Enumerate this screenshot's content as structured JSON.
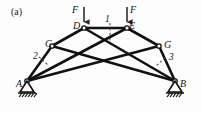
{
  "figure": {
    "panel_label": "(a)",
    "type": "truss-free-body-diagram",
    "width": 202,
    "height": 113,
    "background_color": "#fdfdfd",
    "line_color": "#111111"
  },
  "nodes": [
    {
      "id": "A",
      "label": "A",
      "x": 27,
      "y": 81,
      "support": "pin"
    },
    {
      "id": "B",
      "label": "B",
      "x": 175,
      "y": 81,
      "support": "roller"
    },
    {
      "id": "C",
      "label": "C",
      "x": 52,
      "y": 46,
      "support": "none"
    },
    {
      "id": "D",
      "label": "D",
      "x": 84,
      "y": 28,
      "support": "none"
    },
    {
      "id": "E",
      "label": "E",
      "x": 127,
      "y": 28,
      "support": "none"
    },
    {
      "id": "G",
      "label": "G",
      "x": 159,
      "y": 46,
      "support": "none"
    }
  ],
  "members": [
    {
      "from": "A",
      "to": "C"
    },
    {
      "from": "C",
      "to": "D"
    },
    {
      "from": "D",
      "to": "E"
    },
    {
      "from": "E",
      "to": "G"
    },
    {
      "from": "G",
      "to": "B"
    },
    {
      "from": "A",
      "to": "E"
    },
    {
      "from": "A",
      "to": "G"
    },
    {
      "from": "C",
      "to": "B"
    },
    {
      "from": "D",
      "to": "B"
    }
  ],
  "loads": [
    {
      "id": "F-left",
      "label": "F",
      "at_node": "D",
      "direction": "down",
      "x": 84,
      "tail_y": 7,
      "head_y": 27
    },
    {
      "id": "F-right",
      "label": "F",
      "at_node": "E",
      "direction": "down",
      "x": 127,
      "tail_y": 7,
      "head_y": 27
    }
  ],
  "sections": [
    {
      "id": "1",
      "label": "1",
      "x": 110,
      "y1": 22,
      "y2": 40,
      "style": "dashed-vertical"
    },
    {
      "id": "2",
      "label": "2",
      "x1": 38,
      "y1": 53,
      "x2": 50,
      "y2": 64,
      "style": "dashed-short"
    },
    {
      "id": "3",
      "label": "3",
      "x1": 166,
      "y1": 56,
      "x2": 156,
      "y2": 66,
      "style": "dashed-short"
    }
  ],
  "supports": {
    "A": {
      "kind": "pin",
      "hatch_marks": 6,
      "label": "A"
    },
    "B": {
      "kind": "pin",
      "hatch_marks": 5,
      "label": "B"
    }
  },
  "labels": {
    "panel": "(a)",
    "node_A": "A",
    "node_B": "B",
    "node_C": "C",
    "node_D": "D",
    "node_E": "E",
    "node_G": "G",
    "load_left": "F",
    "load_right": "F",
    "section_1": "1",
    "section_2": "2",
    "section_3": "3"
  }
}
